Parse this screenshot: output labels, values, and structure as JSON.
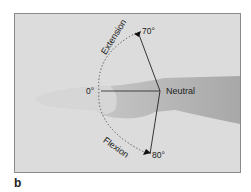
{
  "figure": {
    "panel_label": "b",
    "labels": {
      "extension": "Extension",
      "flexion": "Flexion",
      "neutral": "Neutral",
      "zero": "0°",
      "ext_angle": "70°",
      "flex_angle": "80°"
    },
    "colors": {
      "background": "#dcdcdc",
      "skin_dark": "#b0b0b0",
      "skin_light": "#d2d2d2",
      "line": "#222222"
    }
  }
}
